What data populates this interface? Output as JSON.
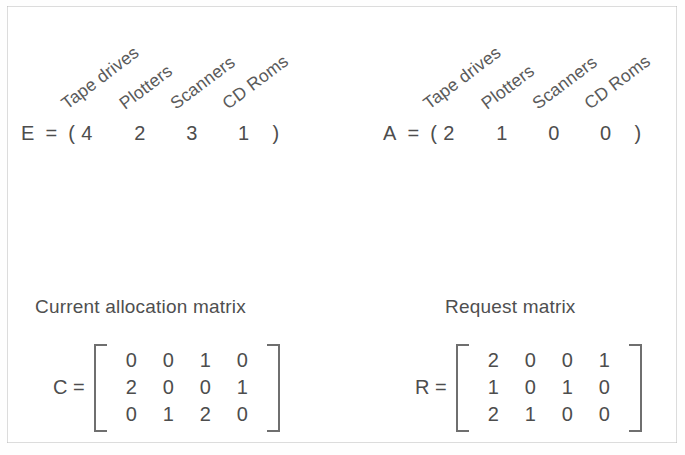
{
  "figure": {
    "resource_labels": [
      "Tape drives",
      "Plotters",
      "Scanners",
      "CD Roms"
    ],
    "vectors": [
      {
        "name": "E",
        "equals": "=",
        "open_paren": "(",
        "close_paren": ")",
        "values": [
          4,
          2,
          3,
          1
        ],
        "labels": [
          "Tape drives",
          "Plotters",
          "Scanners",
          "CD Roms"
        ]
      },
      {
        "name": "A",
        "equals": "=",
        "open_paren": "(",
        "close_paren": ")",
        "values": [
          2,
          1,
          0,
          0
        ],
        "labels": [
          "Tape drives",
          "Plotters",
          "Scanners",
          "CD Roms"
        ]
      }
    ],
    "matrices": [
      {
        "caption": "Current allocation matrix",
        "name": "C",
        "equals": "=",
        "rows": [
          [
            0,
            0,
            1,
            0
          ],
          [
            2,
            0,
            0,
            1
          ],
          [
            0,
            1,
            2,
            0
          ]
        ]
      },
      {
        "caption": "Request matrix",
        "name": "R",
        "equals": "=",
        "rows": [
          [
            2,
            0,
            0,
            1
          ],
          [
            1,
            0,
            1,
            0
          ],
          [
            2,
            1,
            0,
            0
          ]
        ]
      }
    ],
    "colors": {
      "ink": "#4d4d4d",
      "frame": "#8d8d8d",
      "background": "#ffffff"
    }
  }
}
